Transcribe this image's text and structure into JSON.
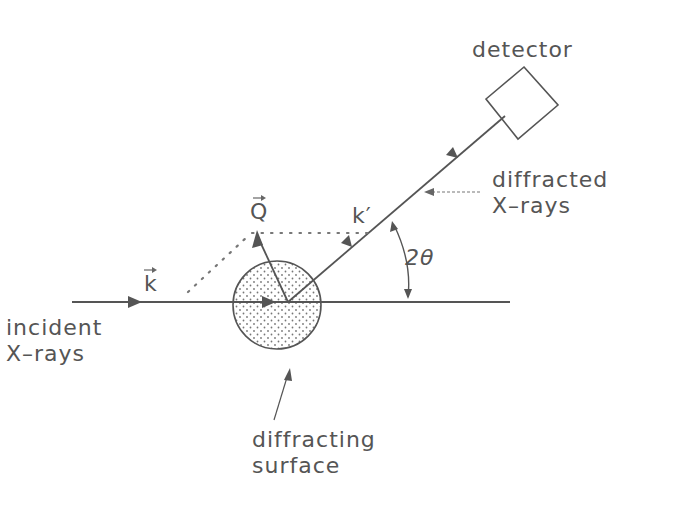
{
  "labels": {
    "detector": "detector",
    "diffracted_1": "diffracted",
    "diffracted_2": "X–rays",
    "incident_1": "incident",
    "incident_2": "X–rays",
    "surface_1": "diffracting",
    "surface_2": "surface",
    "vec_k": "k",
    "vec_k_prime": "k′",
    "vec_q": "Q",
    "angle": "2θ"
  },
  "colors": {
    "line": "#555555",
    "text": "#555555",
    "dots": "#777777"
  }
}
